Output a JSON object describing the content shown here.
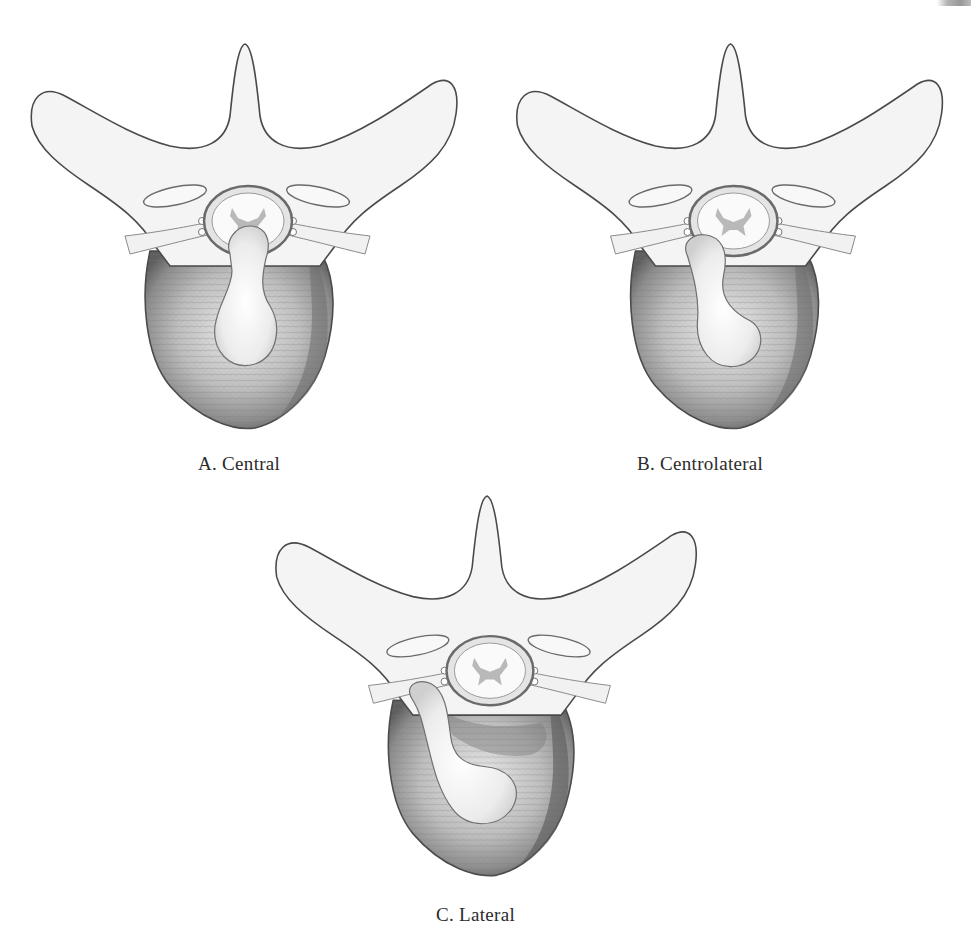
{
  "figure": {
    "type": "anatomical illustration",
    "panels": [
      {
        "id": "A",
        "caption": "A. Central",
        "herniation_position": "central"
      },
      {
        "id": "B",
        "caption": "B. Centrolateral",
        "herniation_position": "centrolateral"
      },
      {
        "id": "C",
        "caption": "C. Lateral",
        "herniation_position": "lateral"
      }
    ]
  },
  "colors": {
    "background": "#ffffff",
    "outline": "#4a4a4a",
    "bone_fill": "#f3f3f3",
    "disc_shade": "#8a8a8a",
    "cord_gray": "#b8b8b8"
  }
}
